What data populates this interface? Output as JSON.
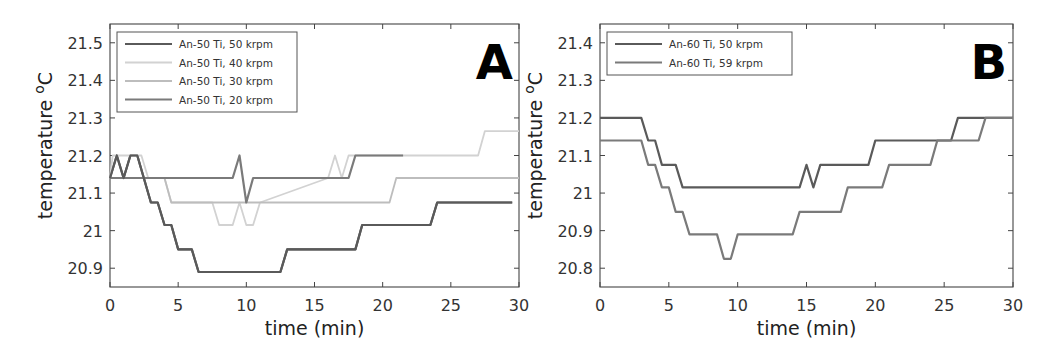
{
  "chart_data": [
    {
      "panel": "A",
      "type": "line",
      "title": "",
      "panel_label": "A",
      "xlabel": "time (min)",
      "ylabel": "temperature °C",
      "xlim": [
        0,
        30
      ],
      "ylim": [
        20.85,
        21.55
      ],
      "xticks": [
        0,
        5,
        10,
        15,
        20,
        25,
        30
      ],
      "xtick_labels": [
        "0",
        "5",
        "10",
        "15",
        "20",
        "25",
        "30"
      ],
      "yticks": [
        20.9,
        21.0,
        21.1,
        21.2,
        21.3,
        21.4,
        21.5
      ],
      "ytick_labels": [
        "20.9",
        "21",
        "21.1",
        "21.2",
        "21.3",
        "21.4",
        "21.5"
      ],
      "grid": false,
      "legend_position": "upper left",
      "series": [
        {
          "name": "An-50 Ti, 50 krpm",
          "color": "#5a5a5a",
          "width": 2.2,
          "x": [
            0,
            0.5,
            1.0,
            1.5,
            2.0,
            3.0,
            3.5,
            4.0,
            4.5,
            5.0,
            6.0,
            6.5,
            12.5,
            13.0,
            18.0,
            18.5,
            23.5,
            24.0,
            29.5
          ],
          "y": [
            21.14,
            21.2,
            21.14,
            21.2,
            21.2,
            21.075,
            21.075,
            21.015,
            21.015,
            20.95,
            20.95,
            20.89,
            20.89,
            20.95,
            20.95,
            21.015,
            21.015,
            21.075,
            21.075
          ]
        },
        {
          "name": "An-50 Ti, 40 krpm",
          "color": "#d2d2d2",
          "width": 1.8,
          "x": [
            0,
            0.2,
            2.3,
            2.8,
            3.0,
            4.0,
            4.5,
            7.5,
            8.0,
            9.0,
            9.5,
            10.0,
            10.5,
            11.0,
            16.0,
            16.5,
            17.0,
            17.5,
            27.0,
            27.5,
            30
          ],
          "y": [
            21.14,
            21.2,
            21.2,
            21.14,
            21.14,
            21.14,
            21.075,
            21.075,
            21.015,
            21.015,
            21.075,
            21.015,
            21.015,
            21.075,
            21.14,
            21.2,
            21.14,
            21.2,
            21.2,
            21.265,
            21.265
          ]
        },
        {
          "name": "An-50 Ti, 30 krpm",
          "color": "#bdbdbd",
          "width": 1.8,
          "x": [
            0,
            4.0,
            4.5,
            20.5,
            21.0,
            30
          ],
          "y": [
            21.14,
            21.14,
            21.075,
            21.075,
            21.14,
            21.14
          ]
        },
        {
          "name": "An-50 Ti, 20 krpm",
          "color": "#7a7a7a",
          "width": 2.2,
          "x": [
            0,
            9.0,
            9.5,
            10.0,
            10.5,
            17.5,
            18.0,
            21.5
          ],
          "y": [
            21.14,
            21.14,
            21.2,
            21.075,
            21.14,
            21.14,
            21.2,
            21.2
          ]
        }
      ]
    },
    {
      "panel": "B",
      "type": "line",
      "title": "",
      "panel_label": "B",
      "xlabel": "time (min)",
      "ylabel": "temperature °C",
      "xlim": [
        0,
        30
      ],
      "ylim": [
        20.75,
        21.45
      ],
      "xticks": [
        0,
        5,
        10,
        15,
        20,
        25,
        30
      ],
      "xtick_labels": [
        "0",
        "5",
        "10",
        "15",
        "20",
        "25",
        "30"
      ],
      "yticks": [
        20.8,
        20.9,
        21.0,
        21.1,
        21.2,
        21.3,
        21.4
      ],
      "ytick_labels": [
        "20.8",
        "20.9",
        "21",
        "21.1",
        "21.2",
        "21.3",
        "21.4"
      ],
      "grid": false,
      "legend_position": "upper left",
      "series": [
        {
          "name": "An-60 Ti, 50 krpm",
          "color": "#5a5a5a",
          "width": 2.2,
          "x": [
            0,
            3.0,
            3.5,
            4.0,
            4.5,
            5.5,
            6.0,
            14.5,
            15.0,
            15.5,
            16.0,
            19.5,
            20.0,
            25.5,
            26.0,
            30
          ],
          "y": [
            21.2,
            21.2,
            21.14,
            21.14,
            21.075,
            21.075,
            21.015,
            21.015,
            21.075,
            21.015,
            21.075,
            21.075,
            21.14,
            21.14,
            21.2,
            21.2
          ]
        },
        {
          "name": "An-60 Ti, 59 krpm",
          "color": "#7a7a7a",
          "width": 2.2,
          "x": [
            0,
            3.0,
            3.5,
            4.0,
            4.5,
            5.0,
            5.5,
            6.0,
            6.5,
            8.5,
            9.0,
            9.5,
            10.0,
            14.0,
            14.5,
            17.5,
            18.0,
            20.5,
            21.0,
            24.0,
            24.5,
            27.5,
            28.0,
            30
          ],
          "y": [
            21.14,
            21.14,
            21.075,
            21.075,
            21.015,
            21.015,
            20.95,
            20.95,
            20.89,
            20.89,
            20.825,
            20.825,
            20.89,
            20.89,
            20.95,
            20.95,
            21.015,
            21.015,
            21.075,
            21.075,
            21.14,
            21.14,
            21.2,
            21.2
          ]
        }
      ]
    }
  ]
}
